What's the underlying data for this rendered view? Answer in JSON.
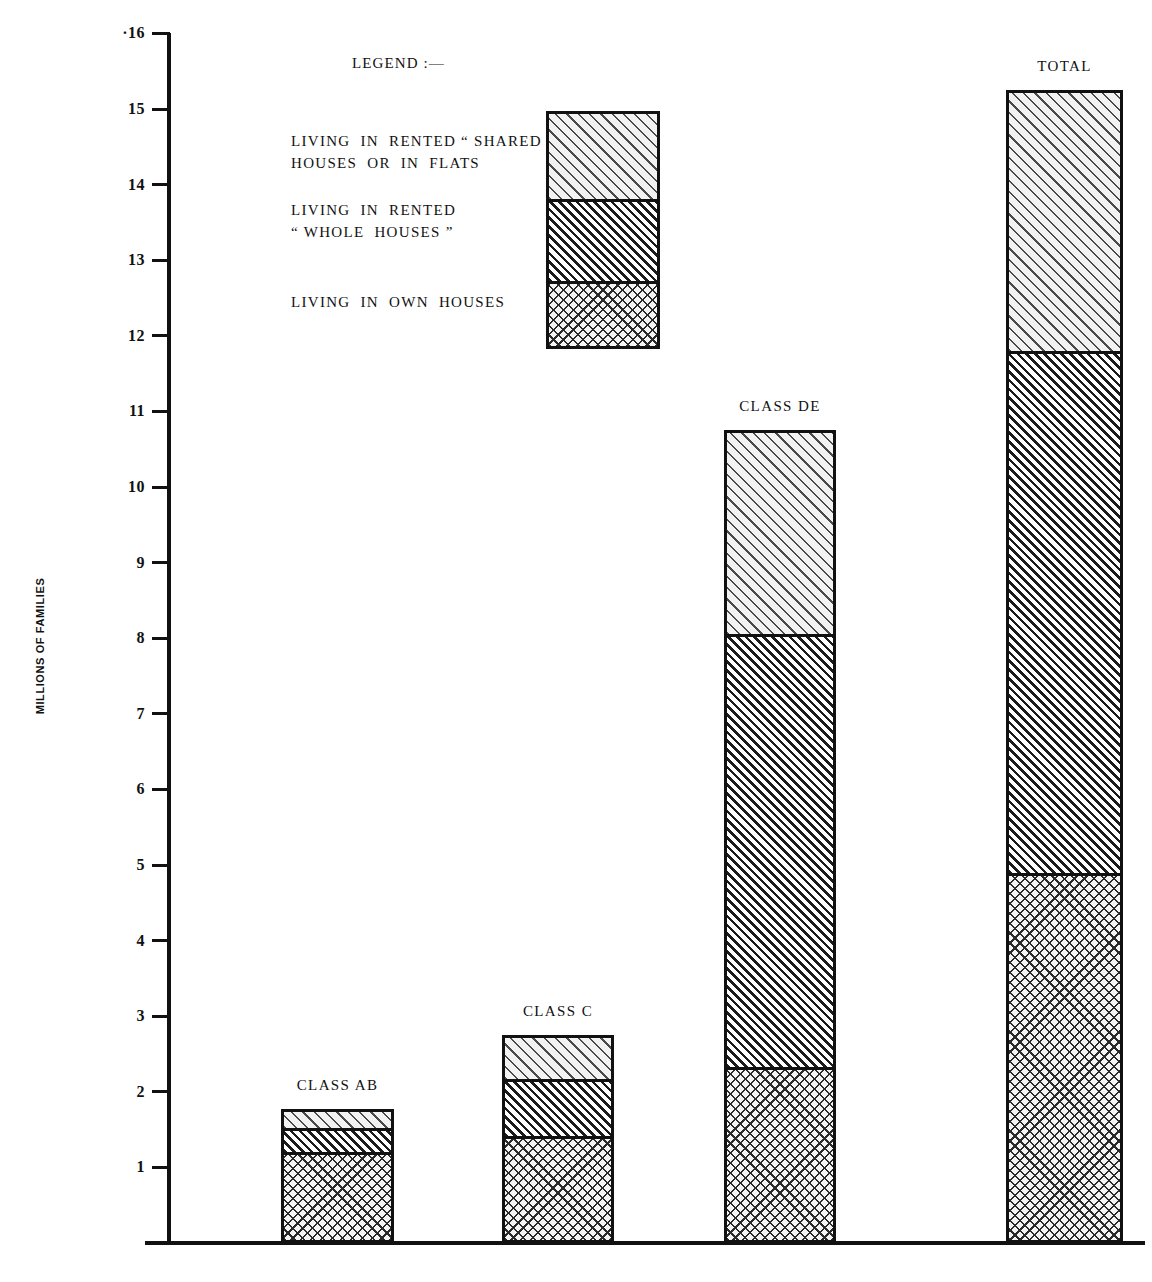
{
  "axis": {
    "y_title": "MILLIONS OF FAMILIES",
    "ticks": [
      "·16",
      "15",
      "14",
      "13",
      "12",
      "11",
      "10",
      "9",
      "8",
      "7",
      "6",
      "5",
      "4",
      "3",
      "2",
      "1"
    ]
  },
  "legend": {
    "title": "LEGEND :—",
    "items": [
      {
        "key": "shared",
        "label_line1": "LIVING  IN  RENTED “ SHARED ”",
        "label_line2": "HOUSES  OR  IN  FLATS",
        "pattern": "light-diagonal-hatch"
      },
      {
        "key": "rented",
        "label_line1": "LIVING  IN  RENTED",
        "label_line2": "“ WHOLE  HOUSES ”",
        "pattern": "dense-diagonal-hatch"
      },
      {
        "key": "own",
        "label_line1": "LIVING  IN  OWN  HOUSES",
        "label_line2": "",
        "pattern": "cross-hatch"
      }
    ]
  },
  "bars": {
    "class_ab": "CLASS  AB",
    "class_c": "CLASS  C",
    "class_de": "CLASS  DE",
    "total": "TOTAL"
  },
  "chart_data": {
    "type": "bar",
    "subtype": "stacked",
    "title": "",
    "xlabel": "",
    "ylabel": "MILLIONS OF FAMILIES",
    "ylim": [
      0,
      16
    ],
    "yticks": [
      1,
      2,
      3,
      4,
      5,
      6,
      7,
      8,
      9,
      10,
      11,
      12,
      13,
      14,
      15,
      16
    ],
    "grid": false,
    "legend_position": "upper-left-inside",
    "categories": [
      "CLASS AB",
      "CLASS C",
      "CLASS DE",
      "TOTAL"
    ],
    "series": [
      {
        "name": "LIVING IN OWN HOUSES",
        "pattern": "cross-hatch",
        "values": [
          1.2,
          1.42,
          2.33,
          4.9
        ]
      },
      {
        "name": "LIVING IN RENTED “WHOLE HOUSES”",
        "pattern": "dense-diagonal-hatch",
        "values": [
          0.32,
          0.75,
          5.73,
          6.9
        ]
      },
      {
        "name": "LIVING IN RENTED “SHARED” HOUSES OR IN FLATS",
        "pattern": "light-diagonal-hatch",
        "values": [
          0.25,
          0.58,
          2.7,
          3.45
        ]
      }
    ],
    "totals": [
      1.77,
      2.75,
      10.76,
      15.25
    ],
    "cumulative_tops": {
      "own": [
        1.2,
        1.42,
        2.33,
        4.9
      ],
      "rented": [
        1.52,
        2.17,
        8.06,
        11.8
      ],
      "shared": [
        1.77,
        2.75,
        10.76,
        15.25
      ]
    }
  }
}
